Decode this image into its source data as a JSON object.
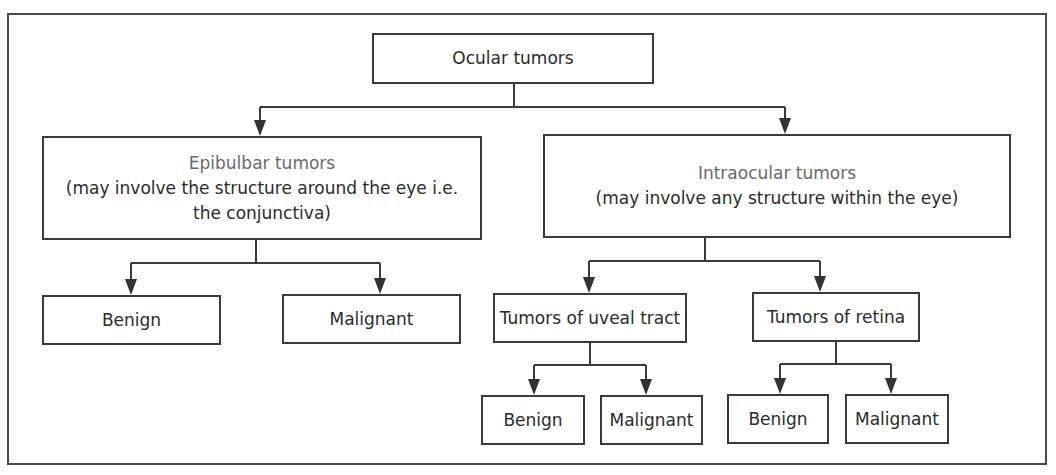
{
  "diagram": {
    "type": "hierarchy",
    "root": {
      "label": "Ocular tumors"
    },
    "epibulbar": {
      "title": "Epibulbar tumors",
      "description_line1": "(may involve the structure around the eye i.e.",
      "description_line2": "the conjunctiva)",
      "children": [
        {
          "label": "Benign"
        },
        {
          "label": "Malignant"
        }
      ]
    },
    "intraocular": {
      "title": "Intraocular tumors",
      "description": "(may involve any structure within the eye)",
      "uveal": {
        "label": "Tumors of uveal tract",
        "children": [
          {
            "label": "Benign"
          },
          {
            "label": "Malignant"
          }
        ]
      },
      "retina": {
        "label": "Tumors of retina",
        "children": [
          {
            "label": "Benign"
          },
          {
            "label": "Malignant"
          }
        ]
      }
    },
    "colors": {
      "line": "#3a3a3a",
      "text": "#2b2b2b",
      "title_text": "#6a6a6a",
      "background": "#ffffff"
    }
  }
}
